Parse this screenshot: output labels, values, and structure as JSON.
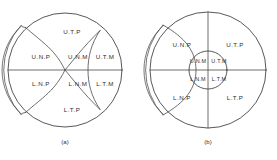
{
  "figure": {
    "background_color": "#ffffff",
    "stroke_color": "#3a3a3a",
    "label_color": "#2e2e2e",
    "panels": [
      {
        "id": "a",
        "caption": "(a)",
        "regions": [
          {
            "key": "utp",
            "label": "U.T.P"
          },
          {
            "key": "unp",
            "label": "U.N.P"
          },
          {
            "key": "unm",
            "label": "U.N.M"
          },
          {
            "key": "utm",
            "label": "U.T.M"
          },
          {
            "key": "lnp",
            "label": "L.N.P"
          },
          {
            "key": "lnm",
            "label": "L.N.M"
          },
          {
            "key": "ltm",
            "label": "L.T.M"
          },
          {
            "key": "ltp",
            "label": "L.T.P"
          }
        ]
      },
      {
        "id": "b",
        "caption": "(b)",
        "regions": [
          {
            "key": "unp",
            "label": "U.N.P"
          },
          {
            "key": "utp",
            "label": "U.T.P"
          },
          {
            "key": "unm",
            "label": "U.N.M"
          },
          {
            "key": "utm",
            "label": "U.T.M"
          },
          {
            "key": "lnm",
            "label": "L.N.M"
          },
          {
            "key": "ltm",
            "label": "L.T.M"
          },
          {
            "key": "lnp",
            "label": "L.N.P"
          },
          {
            "key": "ltp",
            "label": "L.T.P"
          }
        ]
      }
    ]
  }
}
